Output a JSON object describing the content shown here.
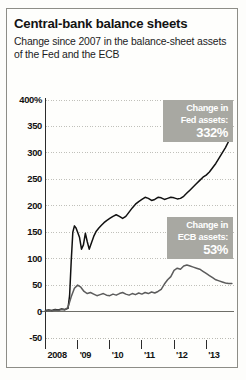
{
  "header": {
    "title": "Central-bank balance sheets",
    "subtitle": "Change since 2007 in the balance-sheet assets of the Fed and the ECB"
  },
  "callouts": {
    "fed": {
      "line1": "Change in",
      "line2": "Fed assets:",
      "value": "332%"
    },
    "ecb": {
      "line1": "Change in",
      "line2": "ECB assets:",
      "value": "53%"
    }
  },
  "chart_data": {
    "type": "line",
    "title": "Central-bank balance sheets",
    "subtitle": "Change since 2007 in the balance-sheet assets of the Fed and the ECB",
    "xlabel": "",
    "ylabel": "%",
    "ylim": [
      -50,
      400
    ],
    "yticks": [
      -50,
      0,
      50,
      100,
      150,
      200,
      250,
      300,
      350,
      400
    ],
    "ytick_labels": [
      "-50",
      "0",
      "50",
      "100",
      "150",
      "200",
      "250",
      "300",
      "350",
      "400%"
    ],
    "xlim": [
      2008,
      2013.85
    ],
    "xticks": [
      2008,
      2009,
      2010,
      2011,
      2012,
      2013
    ],
    "xtick_labels": [
      "2008",
      "'09",
      "'10",
      "'11",
      "'12",
      "'13"
    ],
    "grid": "dotted-horizontal",
    "zero_line": true,
    "legend": "annotated-callouts",
    "series": [
      {
        "name": "Fed assets",
        "final_value": 332,
        "color": "#111111",
        "x": [
          2008.0,
          2008.1,
          2008.2,
          2008.3,
          2008.4,
          2008.5,
          2008.6,
          2008.7,
          2008.75,
          2008.8,
          2008.85,
          2008.9,
          2008.95,
          2009.0,
          2009.06,
          2009.12,
          2009.18,
          2009.24,
          2009.3,
          2009.36,
          2009.42,
          2009.5,
          2009.58,
          2009.66,
          2009.74,
          2009.82,
          2009.9,
          2010.0,
          2010.1,
          2010.2,
          2010.3,
          2010.4,
          2010.5,
          2010.6,
          2010.7,
          2010.8,
          2010.9,
          2011.0,
          2011.1,
          2011.2,
          2011.3,
          2011.4,
          2011.5,
          2011.6,
          2011.7,
          2011.8,
          2011.9,
          2012.0,
          2012.1,
          2012.2,
          2012.3,
          2012.4,
          2012.5,
          2012.6,
          2012.7,
          2012.8,
          2012.9,
          2013.0,
          2013.1,
          2013.2,
          2013.3,
          2013.4,
          2013.5,
          2013.6,
          2013.7,
          2013.8
        ],
        "y": [
          2,
          3,
          2,
          4,
          3,
          5,
          4,
          6,
          30,
          95,
          150,
          162,
          158,
          150,
          140,
          118,
          126,
          148,
          132,
          118,
          128,
          142,
          152,
          158,
          163,
          168,
          172,
          176,
          180,
          183,
          180,
          176,
          180,
          188,
          196,
          203,
          208,
          212,
          216,
          214,
          210,
          212,
          216,
          215,
          212,
          214,
          216,
          215,
          213,
          214,
          218,
          224,
          230,
          236,
          242,
          248,
          254,
          258,
          264,
          272,
          280,
          290,
          300,
          310,
          322,
          332
        ]
      },
      {
        "name": "ECB assets",
        "final_value": 53,
        "color": "#5c5c5c",
        "x": [
          2008.0,
          2008.1,
          2008.2,
          2008.3,
          2008.4,
          2008.5,
          2008.6,
          2008.7,
          2008.8,
          2008.9,
          2009.0,
          2009.1,
          2009.2,
          2009.3,
          2009.4,
          2009.5,
          2009.6,
          2009.7,
          2009.8,
          2009.9,
          2010.0,
          2010.1,
          2010.2,
          2010.3,
          2010.4,
          2010.5,
          2010.6,
          2010.7,
          2010.8,
          2010.9,
          2011.0,
          2011.1,
          2011.2,
          2011.3,
          2011.4,
          2011.5,
          2011.6,
          2011.7,
          2011.8,
          2011.9,
          2012.0,
          2012.1,
          2012.2,
          2012.3,
          2012.4,
          2012.5,
          2012.6,
          2012.7,
          2012.8,
          2012.9,
          2013.0,
          2013.1,
          2013.2,
          2013.3,
          2013.4,
          2013.5,
          2013.6,
          2013.7,
          2013.8
        ],
        "y": [
          1,
          2,
          1,
          3,
          2,
          4,
          3,
          8,
          28,
          44,
          50,
          46,
          38,
          34,
          36,
          33,
          30,
          32,
          34,
          31,
          30,
          33,
          31,
          34,
          36,
          33,
          31,
          34,
          32,
          35,
          33,
          36,
          34,
          37,
          35,
          38,
          42,
          52,
          60,
          66,
          78,
          82,
          80,
          86,
          88,
          86,
          84,
          82,
          80,
          76,
          72,
          68,
          64,
          60,
          58,
          56,
          54,
          53,
          53
        ]
      }
    ]
  },
  "colors": {
    "frame": "#8d8d87",
    "callout_bg": "#a8a8a2",
    "callout_text": "#ffffff",
    "fed_line": "#111111",
    "ecb_line": "#5c5c5c",
    "grid": "#b9b9b3",
    "zero_line": "#6e6e68"
  }
}
